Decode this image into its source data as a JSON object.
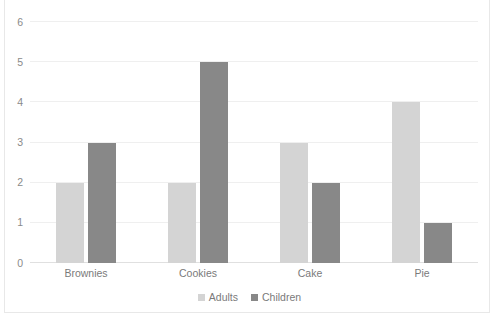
{
  "chart_data": {
    "type": "bar",
    "title": "",
    "title_note": "clipped-above-top-edge",
    "xlabel": "",
    "ylabel": "",
    "categories": [
      "Brownies",
      "Cookies",
      "Cake",
      "Pie"
    ],
    "series": [
      {
        "name": "Adults",
        "color": "#d4d4d4",
        "values": [
          2,
          2,
          3,
          4
        ]
      },
      {
        "name": "Children",
        "color": "#888888",
        "values": [
          3,
          5,
          2,
          1
        ]
      }
    ],
    "ylim": [
      0,
      6
    ],
    "yticks": [
      0,
      1,
      2,
      3,
      4,
      5,
      6
    ],
    "ytick_labels": [
      "0",
      "1",
      "2",
      "3",
      "4",
      "5",
      "6"
    ],
    "grid": true,
    "grid_axis": "y",
    "legend_position": "bottom-center",
    "orientation": "vertical",
    "grouping": "grouped"
  },
  "colors": {
    "background": "#ffffff",
    "gridline": "#efefef",
    "border": "#e8e8e8",
    "axis_text": "#8a8a8a",
    "category_text": "#7a7a7a",
    "legend_text": "#7a7a7a"
  }
}
